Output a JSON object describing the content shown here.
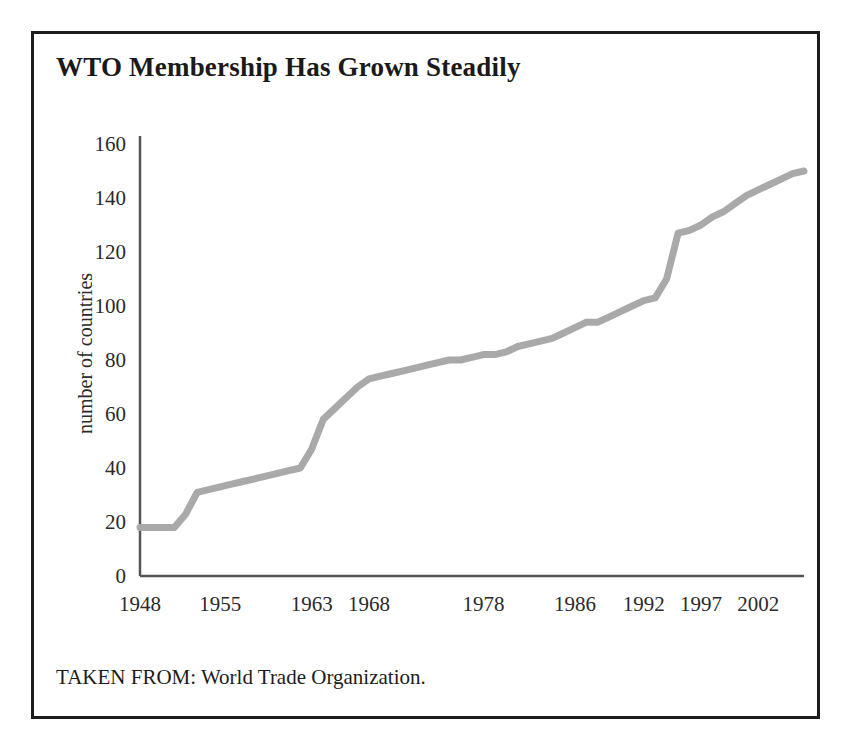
{
  "figure": {
    "title": "WTO Membership Has Grown Steadily",
    "caption": "TAKEN FROM: World Trade Organization.",
    "border_color": "#1c1c1c",
    "background": "#ffffff"
  },
  "chart_data": {
    "type": "line",
    "title": "WTO Membership Has Grown Steadily",
    "xlabel": "",
    "ylabel": "number of countries",
    "ylim": [
      0,
      160
    ],
    "xlim": [
      1948,
      2006
    ],
    "grid": false,
    "legend": null,
    "line_color": "#a9a9a9",
    "line_width": 7,
    "axis_color": "#555555",
    "y_ticks": [
      0,
      20,
      40,
      60,
      80,
      100,
      120,
      140,
      160
    ],
    "x_ticks": [
      1948,
      1955,
      1963,
      1968,
      1978,
      1986,
      1992,
      1997,
      2002
    ],
    "x_tick_labels": [
      "1948",
      "1955",
      "1963",
      "1968",
      "1978",
      "1986",
      "1992",
      "1997",
      "2002"
    ],
    "y_tick_labels": [
      "0",
      "20",
      "40",
      "60",
      "80",
      "100",
      "120",
      "140",
      "160"
    ],
    "series": [
      {
        "name": "number of countries",
        "x": [
          1948,
          1949,
          1950,
          1951,
          1952,
          1953,
          1954,
          1955,
          1956,
          1957,
          1958,
          1959,
          1960,
          1961,
          1962,
          1963,
          1964,
          1965,
          1966,
          1967,
          1968,
          1969,
          1970,
          1971,
          1972,
          1973,
          1974,
          1975,
          1976,
          1977,
          1978,
          1979,
          1980,
          1981,
          1982,
          1983,
          1984,
          1985,
          1986,
          1987,
          1988,
          1989,
          1990,
          1991,
          1992,
          1993,
          1994,
          1995,
          1996,
          1997,
          1998,
          1999,
          2000,
          2001,
          2002,
          2003,
          2004,
          2005,
          2006
        ],
        "y": [
          18,
          18,
          18,
          18,
          23,
          31,
          32,
          33,
          34,
          35,
          36,
          37,
          38,
          39,
          40,
          47,
          58,
          62,
          66,
          70,
          73,
          74,
          75,
          76,
          77,
          78,
          79,
          80,
          80,
          81,
          82,
          82,
          83,
          85,
          86,
          87,
          88,
          90,
          92,
          94,
          94,
          96,
          98,
          100,
          102,
          103,
          110,
          127,
          128,
          130,
          133,
          135,
          138,
          141,
          143,
          145,
          147,
          149,
          150
        ]
      }
    ],
    "annotations": []
  },
  "plot": {
    "y_axis_title": "number of countries"
  }
}
